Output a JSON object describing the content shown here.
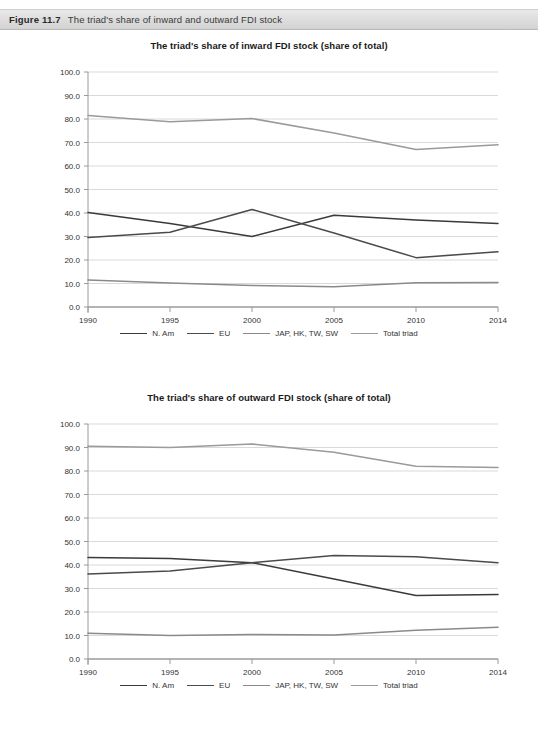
{
  "figure": {
    "label": "Figure 11.7",
    "caption": "The triad's share of inward and outward FDI stock"
  },
  "colors": {
    "n_am": "#3a3a3a",
    "eu": "#4a4a4a",
    "jap": "#8a8a8a",
    "total": "#9a9a9a",
    "grid": "#d9d9d9",
    "axis": "#9a9a9a",
    "text": "#333333"
  },
  "legend": {
    "items": [
      {
        "label": "N. Am",
        "color": "#3a3a3a"
      },
      {
        "label": "EU",
        "color": "#4a4a4a"
      },
      {
        "label": "JAP, HK, TW, SW",
        "color": "#8a8a8a"
      },
      {
        "label": "Total triad",
        "color": "#9a9a9a"
      }
    ]
  },
  "chart_data": [
    {
      "type": "line",
      "title": "The triad's share of inward FDI stock (share of total)",
      "xlabel": "",
      "ylabel": "",
      "categories": [
        "1990",
        "1995",
        "2000",
        "2005",
        "2010",
        "2014"
      ],
      "x_tick_labels": [
        "1990",
        "1995",
        "2000",
        "2005",
        "2010",
        "2014"
      ],
      "y_tick_labels": [
        "0.0",
        "10.0",
        "20.0",
        "30.0",
        "40.0",
        "50.0",
        "60.0",
        "70.0",
        "80.0",
        "90.0",
        "100.0"
      ],
      "ylim": [
        0,
        100
      ],
      "ytick_step": 10,
      "grid": true,
      "legend_position": "bottom",
      "series": [
        {
          "name": "N. Am",
          "color": "#3a3a3a",
          "values": [
            40.2,
            35.5,
            30.0,
            39.0,
            37.0,
            35.5
          ]
        },
        {
          "name": "EU",
          "color": "#4a4a4a",
          "values": [
            29.6,
            31.8,
            41.5,
            31.5,
            21.0,
            23.5
          ]
        },
        {
          "name": "JAP, HK, TW, SW",
          "color": "#8a8a8a",
          "values": [
            11.5,
            10.2,
            9.2,
            8.6,
            10.3,
            10.4
          ]
        },
        {
          "name": "Total triad",
          "color": "#9a9a9a",
          "values": [
            81.5,
            78.8,
            80.2,
            74.0,
            67.0,
            69.0
          ]
        }
      ]
    },
    {
      "type": "line",
      "title": "The triad's share of outward FDI stock (share of total)",
      "xlabel": "",
      "ylabel": "",
      "categories": [
        "1990",
        "1995",
        "2000",
        "2005",
        "2010",
        "2014"
      ],
      "x_tick_labels": [
        "1990",
        "1995",
        "2000",
        "2005",
        "2010",
        "2014"
      ],
      "y_tick_labels": [
        "0.0",
        "10.0",
        "20.0",
        "30.0",
        "40.0",
        "50.0",
        "60.0",
        "70.0",
        "80.0",
        "90.0",
        "100.0"
      ],
      "ylim": [
        0,
        100
      ],
      "ytick_step": 10,
      "grid": true,
      "legend_position": "bottom",
      "series": [
        {
          "name": "N. Am",
          "color": "#3a3a3a",
          "values": [
            43.2,
            42.8,
            41.0,
            34.0,
            27.0,
            27.5
          ]
        },
        {
          "name": "EU",
          "color": "#4a4a4a",
          "values": [
            36.2,
            37.5,
            41.0,
            44.0,
            43.5,
            41.0
          ]
        },
        {
          "name": "JAP, HK, TW, SW",
          "color": "#8a8a8a",
          "values": [
            11.0,
            10.0,
            10.4,
            10.2,
            12.2,
            13.5
          ]
        },
        {
          "name": "Total triad",
          "color": "#9a9a9a",
          "values": [
            90.5,
            90.0,
            91.5,
            88.0,
            82.0,
            81.5
          ]
        }
      ]
    }
  ]
}
